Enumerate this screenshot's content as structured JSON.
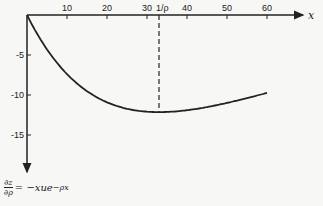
{
  "chart_data": {
    "type": "line",
    "title": "",
    "xlabel": "x",
    "ylabel": "∂z/∂ρ = −xue^(−ρx)",
    "x_ticks": [
      10,
      20,
      30,
      40,
      50,
      60
    ],
    "y_ticks": [
      -5,
      -10,
      -15
    ],
    "xlim": [
      0,
      70
    ],
    "ylim": [
      -20,
      0
    ],
    "grid": false,
    "annotations": [
      {
        "x": 33,
        "label": "1/ρ",
        "style": "dashed vertical line"
      }
    ],
    "series": [
      {
        "name": "∂z/∂ρ",
        "x": [
          0,
          5,
          10,
          15,
          20,
          25,
          30,
          33,
          40,
          45,
          50,
          55,
          60
        ],
        "values": [
          0,
          -4.3,
          -7.4,
          -9.5,
          -10.9,
          -11.7,
          -12.1,
          -12.2,
          -11.9,
          -11.5,
          -11.0,
          -10.4,
          -9.7
        ]
      }
    ]
  },
  "labels": {
    "x_axis": "x",
    "y_axis_formula_num": "∂z",
    "y_axis_formula_den": "∂ρ",
    "y_axis_formula_rhs": "= −xue",
    "y_axis_formula_exp": "−ρx",
    "annotation": "1/ρ",
    "x_ticks": [
      "10",
      "20",
      "30",
      "40",
      "50",
      "60"
    ],
    "y_ticks": [
      "-5",
      "-10",
      "-15"
    ]
  }
}
